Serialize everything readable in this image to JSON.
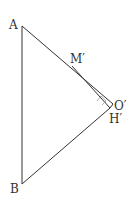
{
  "diagram": {
    "labels": {
      "A": "A",
      "B": "B",
      "M": "M′",
      "O": "O′",
      "H": "H′"
    },
    "points": {
      "A": [
        22,
        26
      ],
      "B": [
        22,
        184
      ],
      "M": [
        72,
        64
      ],
      "O": [
        113,
        104
      ],
      "H": [
        110,
        108
      ]
    },
    "segments": [
      "AB",
      "AO′",
      "M′H′",
      "BH′",
      "H′O′"
    ],
    "annotations": [
      "right-angle-at-H′"
    ],
    "stroke_color": "#333333"
  }
}
